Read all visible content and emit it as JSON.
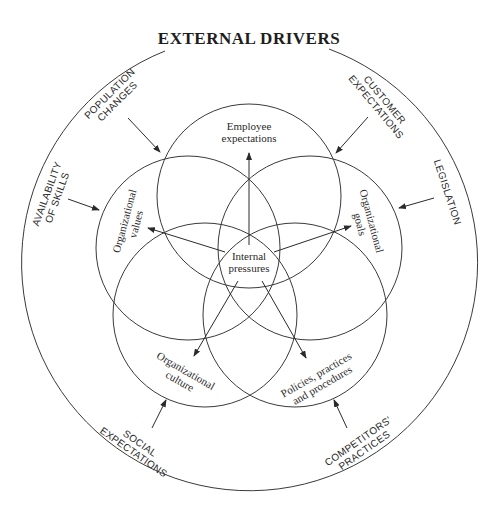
{
  "title": "EXTERNAL DRIVERS",
  "center": {
    "line1": "Internal",
    "line2": "pressures"
  },
  "internal_factors": [
    {
      "id": "employee",
      "line1": "Employee",
      "line2": "expectations"
    },
    {
      "id": "values",
      "line1": "Organizational",
      "line2": "values"
    },
    {
      "id": "goals",
      "line1": "Organizational",
      "line2": "goals"
    },
    {
      "id": "culture",
      "line1": "Organizational",
      "line2": "culture"
    },
    {
      "id": "policies",
      "line1": "Policies, practices",
      "line2": "and procedures"
    }
  ],
  "external_drivers": [
    {
      "id": "population",
      "line1": "POPULATION",
      "line2": "CHANGES"
    },
    {
      "id": "customer",
      "line1": "CUSTOMER",
      "line2": "EXPECTATIONS"
    },
    {
      "id": "skills",
      "line1": "AVAILABILITY",
      "line2": "OF SKILLS"
    },
    {
      "id": "legislation",
      "line1": "LEGISLATION",
      "line2": ""
    },
    {
      "id": "social",
      "line1": "SOCIAL",
      "line2": "EXPECTATIONS"
    },
    {
      "id": "competitors",
      "line1": "COMPETITORS'",
      "line2": "PRACTICES"
    }
  ],
  "colors": {
    "stroke": "#3a3a3a",
    "text": "#2a2a2a",
    "background": "#ffffff"
  }
}
